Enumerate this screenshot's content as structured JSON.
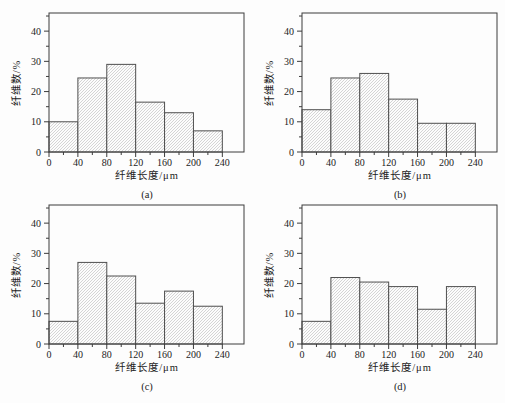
{
  "figure": {
    "background": "#fdfdfd",
    "description_visible_text_only": true
  },
  "colors": {
    "axis": "#3c3c3c",
    "bar_edge": "#4f4f4f",
    "bar_fill": "#fcfcfc",
    "hatch": "#c3c3c3",
    "text": "#1c1c1c"
  },
  "chart_data": [
    {
      "type": "bar",
      "subtype": "histogram",
      "caption": "(a)",
      "xlabel": "纤维长度/μm",
      "ylabel": "纤维数/%",
      "bin_edges": [
        0,
        40,
        80,
        120,
        160,
        200,
        240
      ],
      "categories": [
        "0-40",
        "40-80",
        "80-120",
        "120-160",
        "160-200",
        "200-240"
      ],
      "values": [
        10,
        24.5,
        29,
        16.5,
        13,
        7
      ],
      "xlim": [
        0,
        270
      ],
      "ylim": [
        0,
        46
      ],
      "xticks": [
        0,
        40,
        80,
        120,
        160,
        200,
        240
      ],
      "yticks": [
        0,
        10,
        20,
        30,
        40
      ],
      "x_minor_ticks": [
        20,
        60,
        100,
        140,
        180,
        220
      ],
      "y_minor_ticks": [
        5,
        15,
        25,
        35,
        45
      ],
      "grid": false,
      "legend": null,
      "hatch": "diagonal"
    },
    {
      "type": "bar",
      "subtype": "histogram",
      "caption": "(b)",
      "xlabel": "纤维长度/μm",
      "ylabel": "纤维数/%",
      "bin_edges": [
        0,
        40,
        80,
        120,
        160,
        200,
        240
      ],
      "categories": [
        "0-40",
        "40-80",
        "80-120",
        "120-160",
        "160-200",
        "200-240"
      ],
      "values": [
        14,
        24.5,
        26,
        17.5,
        9.5,
        9.5
      ],
      "xlim": [
        0,
        270
      ],
      "ylim": [
        0,
        46
      ],
      "xticks": [
        0,
        40,
        80,
        120,
        160,
        200,
        240
      ],
      "yticks": [
        0,
        10,
        20,
        30,
        40
      ],
      "x_minor_ticks": [
        20,
        60,
        100,
        140,
        180,
        220
      ],
      "y_minor_ticks": [
        5,
        15,
        25,
        35,
        45
      ],
      "grid": false,
      "legend": null,
      "hatch": "diagonal"
    },
    {
      "type": "bar",
      "subtype": "histogram",
      "caption": "(c)",
      "xlabel": "纤维长度/μm",
      "ylabel": "纤维数/%",
      "bin_edges": [
        0,
        40,
        80,
        120,
        160,
        200,
        240
      ],
      "categories": [
        "0-40",
        "40-80",
        "80-120",
        "120-160",
        "160-200",
        "200-240"
      ],
      "values": [
        7.5,
        27,
        22.5,
        13.5,
        17.5,
        12.5
      ],
      "xlim": [
        0,
        270
      ],
      "ylim": [
        0,
        46
      ],
      "xticks": [
        0,
        40,
        80,
        120,
        160,
        200,
        240
      ],
      "yticks": [
        0,
        10,
        20,
        30,
        40
      ],
      "x_minor_ticks": [
        20,
        60,
        100,
        140,
        180,
        220
      ],
      "y_minor_ticks": [
        5,
        15,
        25,
        35,
        45
      ],
      "grid": false,
      "legend": null,
      "hatch": "diagonal"
    },
    {
      "type": "bar",
      "subtype": "histogram",
      "caption": "(d)",
      "xlabel": "纤维长度/μm",
      "ylabel": "纤维数/%",
      "bin_edges": [
        0,
        40,
        80,
        120,
        160,
        200,
        240
      ],
      "categories": [
        "0-40",
        "40-80",
        "80-120",
        "120-160",
        "160-200",
        "200-240"
      ],
      "values": [
        7.5,
        22,
        20.5,
        19,
        11.5,
        19
      ],
      "xlim": [
        0,
        270
      ],
      "ylim": [
        0,
        46
      ],
      "xticks": [
        0,
        40,
        80,
        120,
        160,
        200,
        240
      ],
      "yticks": [
        0,
        10,
        20,
        30,
        40
      ],
      "x_minor_ticks": [
        20,
        60,
        100,
        140,
        180,
        220
      ],
      "y_minor_ticks": [
        5,
        15,
        25,
        35,
        45
      ],
      "grid": false,
      "legend": null,
      "hatch": "diagonal"
    }
  ]
}
